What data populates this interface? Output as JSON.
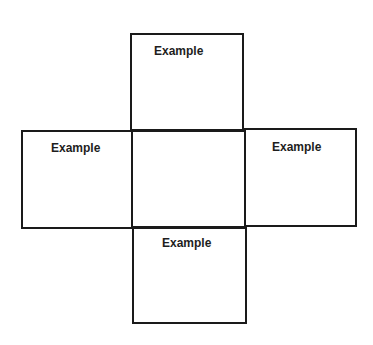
{
  "diagram": {
    "type": "cross-net",
    "line_color": "#1a1a1a",
    "background": "#ffffff",
    "boxes": [
      {
        "id": "top",
        "label": "Example"
      },
      {
        "id": "left",
        "label": "Example"
      },
      {
        "id": "center",
        "label": ""
      },
      {
        "id": "right",
        "label": "Example"
      },
      {
        "id": "bottom",
        "label": "Example"
      }
    ]
  }
}
